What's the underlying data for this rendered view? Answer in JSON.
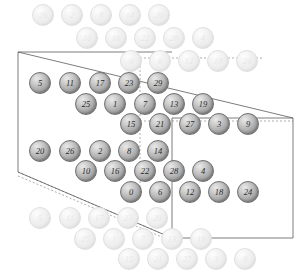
{
  "figure": {
    "type": "lattice-unit-cell-diagram",
    "title": "",
    "sphere_count_in_cell": 30,
    "label_range": "0-29",
    "colors": {
      "sphere_fill": "#ababab",
      "sphere_edge": "#6f6f6f",
      "sphere_label": "#2b2b2b",
      "ghost_fill": "#ececec",
      "ghost_edge": "#e0e0e0",
      "ghost_label": "#dedede",
      "cell_line": "#5a5a5a",
      "cell_dashed_line": "#8a8a8a",
      "background": "#ffffff"
    }
  },
  "cell": {
    "name": "unit-cell-parallelepiped",
    "front_face": {
      "points": "18,52 18,172 172,238 172,118"
    },
    "top_edge": {
      "points": "18,52 172,118"
    },
    "solid_segments": [
      {
        "name": "front-left-vertical",
        "x1": 18,
        "y1": 52,
        "x2": 18,
        "y2": 172
      },
      {
        "name": "front-top-horizontal",
        "x1": 18,
        "y1": 52,
        "x2": 172,
        "y2": 52
      },
      {
        "name": "front-bottom-to-back",
        "x1": 18,
        "y1": 172,
        "x2": 172,
        "y2": 238
      },
      {
        "name": "top-diagonal",
        "x1": 18,
        "y1": 52,
        "x2": 293,
        "y2": 118
      },
      {
        "name": "back-right-vertical",
        "x1": 293,
        "y1": 118,
        "x2": 293,
        "y2": 238
      },
      {
        "name": "back-top-horizontal",
        "x1": 172,
        "y1": 118,
        "x2": 293,
        "y2": 118
      },
      {
        "name": "back-bottom-horizontal",
        "x1": 172,
        "y1": 238,
        "x2": 293,
        "y2": 238
      },
      {
        "name": "mid-vertical",
        "x1": 172,
        "y1": 118,
        "x2": 172,
        "y2": 238
      }
    ],
    "dashed_segments": [
      {
        "name": "hidden-vertical-upper",
        "x1": 140,
        "y1": 58,
        "x2": 140,
        "y2": 121
      },
      {
        "name": "hidden-vertical-lower",
        "x1": 140,
        "y1": 121,
        "x2": 140,
        "y2": 196
      },
      {
        "name": "hidden-horizontal-top",
        "x1": 140,
        "y1": 58,
        "x2": 262,
        "y2": 58
      },
      {
        "name": "hidden-horizontal-mid",
        "x1": 140,
        "y1": 121,
        "x2": 293,
        "y2": 121
      },
      {
        "name": "hidden-bottom-diagonal",
        "x1": 18,
        "y1": 172,
        "x2": 172,
        "y2": 238
      },
      {
        "name": "hidden-lower-diagonal",
        "x1": 18,
        "y1": 176,
        "x2": 176,
        "y2": 243
      }
    ]
  },
  "spheres": [
    {
      "label": "26",
      "x": 43,
      "y": 15,
      "state": "ghost"
    },
    {
      "label": "2",
      "x": 72,
      "y": 15,
      "state": "ghost"
    },
    {
      "label": "8",
      "x": 101,
      "y": 15,
      "state": "ghost"
    },
    {
      "label": "14",
      "x": 130,
      "y": 15,
      "state": "ghost"
    },
    {
      "label": "20",
      "x": 159,
      "y": 15,
      "state": "ghost"
    },
    {
      "label": "10",
      "x": 87,
      "y": 38,
      "state": "ghost"
    },
    {
      "label": "16",
      "x": 116,
      "y": 38,
      "state": "ghost"
    },
    {
      "label": "22",
      "x": 145,
      "y": 38,
      "state": "ghost"
    },
    {
      "label": "28",
      "x": 174,
      "y": 38,
      "state": "ghost"
    },
    {
      "label": "4",
      "x": 203,
      "y": 38,
      "state": "ghost"
    },
    {
      "label": "0",
      "x": 131,
      "y": 61,
      "state": "ghost"
    },
    {
      "label": "6",
      "x": 160,
      "y": 61,
      "state": "ghost"
    },
    {
      "label": "12",
      "x": 189,
      "y": 61,
      "state": "ghost"
    },
    {
      "label": "18",
      "x": 218,
      "y": 61,
      "state": "ghost"
    },
    {
      "label": "24",
      "x": 247,
      "y": 61,
      "state": "ghost"
    },
    {
      "label": "5",
      "x": 40,
      "y": 83,
      "state": "solid"
    },
    {
      "label": "11",
      "x": 70,
      "y": 83,
      "state": "solid"
    },
    {
      "label": "17",
      "x": 100,
      "y": 83,
      "state": "solid"
    },
    {
      "label": "23",
      "x": 129,
      "y": 83,
      "state": "solid"
    },
    {
      "label": "29",
      "x": 158,
      "y": 83,
      "state": "solid"
    },
    {
      "label": "25",
      "x": 86,
      "y": 104,
      "state": "solid"
    },
    {
      "label": "1",
      "x": 115,
      "y": 104,
      "state": "solid"
    },
    {
      "label": "7",
      "x": 145,
      "y": 104,
      "state": "solid"
    },
    {
      "label": "13",
      "x": 174,
      "y": 104,
      "state": "solid"
    },
    {
      "label": "19",
      "x": 203,
      "y": 104,
      "state": "solid"
    },
    {
      "label": "15",
      "x": 131,
      "y": 124,
      "state": "solid"
    },
    {
      "label": "21",
      "x": 160,
      "y": 124,
      "state": "solid"
    },
    {
      "label": "27",
      "x": 190,
      "y": 124,
      "state": "solid"
    },
    {
      "label": "3",
      "x": 219,
      "y": 124,
      "state": "solid"
    },
    {
      "label": "9",
      "x": 248,
      "y": 124,
      "state": "solid"
    },
    {
      "label": "20",
      "x": 40,
      "y": 151,
      "state": "solid"
    },
    {
      "label": "26",
      "x": 70,
      "y": 151,
      "state": "solid"
    },
    {
      "label": "2",
      "x": 100,
      "y": 151,
      "state": "solid"
    },
    {
      "label": "8",
      "x": 129,
      "y": 151,
      "state": "solid"
    },
    {
      "label": "14",
      "x": 158,
      "y": 151,
      "state": "solid"
    },
    {
      "label": "10",
      "x": 86,
      "y": 171,
      "state": "solid"
    },
    {
      "label": "16",
      "x": 115,
      "y": 171,
      "state": "solid"
    },
    {
      "label": "22",
      "x": 145,
      "y": 171,
      "state": "solid"
    },
    {
      "label": "28",
      "x": 174,
      "y": 171,
      "state": "solid"
    },
    {
      "label": "4",
      "x": 203,
      "y": 171,
      "state": "solid"
    },
    {
      "label": "0",
      "x": 131,
      "y": 192,
      "state": "solid"
    },
    {
      "label": "6",
      "x": 160,
      "y": 192,
      "state": "solid"
    },
    {
      "label": "12",
      "x": 190,
      "y": 192,
      "state": "solid"
    },
    {
      "label": "18",
      "x": 219,
      "y": 192,
      "state": "solid"
    },
    {
      "label": "24",
      "x": 248,
      "y": 192,
      "state": "solid"
    },
    {
      "label": "5",
      "x": 40,
      "y": 218,
      "state": "ghost"
    },
    {
      "label": "11",
      "x": 70,
      "y": 218,
      "state": "ghost"
    },
    {
      "label": "17",
      "x": 99,
      "y": 218,
      "state": "ghost"
    },
    {
      "label": "23",
      "x": 128,
      "y": 218,
      "state": "ghost"
    },
    {
      "label": "29",
      "x": 157,
      "y": 218,
      "state": "ghost"
    },
    {
      "label": "25",
      "x": 85,
      "y": 239,
      "state": "ghost"
    },
    {
      "label": "1",
      "x": 114,
      "y": 239,
      "state": "ghost"
    },
    {
      "label": "7",
      "x": 143,
      "y": 239,
      "state": "ghost"
    },
    {
      "label": "13",
      "x": 172,
      "y": 239,
      "state": "ghost"
    },
    {
      "label": "19",
      "x": 201,
      "y": 239,
      "state": "ghost"
    },
    {
      "label": "15",
      "x": 129,
      "y": 259,
      "state": "ghost"
    },
    {
      "label": "21",
      "x": 158,
      "y": 259,
      "state": "ghost"
    },
    {
      "label": "27",
      "x": 187,
      "y": 259,
      "state": "ghost"
    },
    {
      "label": "3",
      "x": 216,
      "y": 259,
      "state": "ghost"
    },
    {
      "label": "9",
      "x": 245,
      "y": 259,
      "state": "ghost"
    }
  ],
  "geometry": {
    "sphere_diameter": 22,
    "ghost_diameter": 22,
    "canvas_width": 308,
    "canvas_height": 277
  }
}
